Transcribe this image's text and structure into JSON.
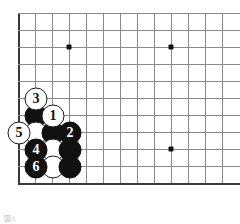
{
  "figure": {
    "kind": "go-board-diagram",
    "caption": "図5",
    "board": {
      "origin_x": 18,
      "origin_y": 13,
      "spacing": 17,
      "cols": 13,
      "rows": 11,
      "left_edge_col": 0,
      "bottom_edge_row": 10,
      "line_color": "#8a8a8a",
      "edge_color": "#3a3a3a",
      "background": "#ffffff"
    },
    "star_points": [
      {
        "col": 3,
        "row": 2
      },
      {
        "col": 9,
        "row": 2
      },
      {
        "col": 9,
        "row": 8
      }
    ],
    "stones": [
      {
        "col": 1,
        "row": 5,
        "color": "white",
        "label": "3"
      },
      {
        "col": 1,
        "row": 6,
        "color": "black",
        "label": ""
      },
      {
        "col": 2,
        "row": 6,
        "color": "white",
        "label": "1"
      },
      {
        "col": 0,
        "row": 7,
        "color": "white",
        "label": "5"
      },
      {
        "col": 1,
        "row": 7,
        "color": "white",
        "label": ""
      },
      {
        "col": 2,
        "row": 7,
        "color": "black",
        "label": ""
      },
      {
        "col": 3,
        "row": 7,
        "color": "black",
        "label": "2"
      },
      {
        "col": 1,
        "row": 8,
        "color": "black",
        "label": "4"
      },
      {
        "col": 2,
        "row": 8,
        "color": "white",
        "label": ""
      },
      {
        "col": 3,
        "row": 8,
        "color": "black",
        "label": ""
      },
      {
        "col": 1,
        "row": 9,
        "color": "black",
        "label": "6"
      },
      {
        "col": 2,
        "row": 9,
        "color": "white",
        "label": ""
      },
      {
        "col": 3,
        "row": 9,
        "color": "black",
        "label": ""
      }
    ]
  }
}
